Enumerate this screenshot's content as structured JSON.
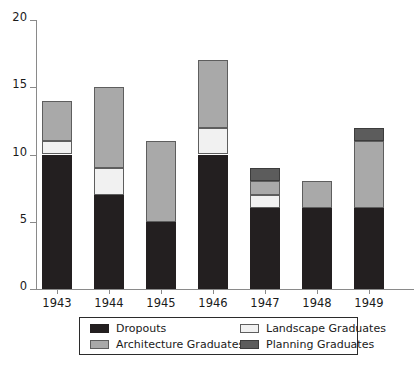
{
  "chart_data": {
    "type": "bar",
    "stacked": true,
    "title": "",
    "subtitle": "",
    "xlabel": "",
    "ylabel": "",
    "categories": [
      "1943",
      "1944",
      "1945",
      "1946",
      "1947",
      "1948",
      "1949"
    ],
    "series": [
      {
        "name": "Dropouts",
        "color": "#231f20",
        "values": [
          10,
          7,
          5,
          10,
          6,
          6,
          6
        ]
      },
      {
        "name": "Landscape Graduates",
        "color": "#f1f1f1",
        "values": [
          1,
          2,
          0,
          2,
          1,
          0,
          0
        ]
      },
      {
        "name": "Architecture Graduates",
        "color": "#a9a9a9",
        "values": [
          3,
          6,
          6,
          5,
          1,
          2,
          5
        ]
      },
      {
        "name": "Planning Graduates",
        "color": "#5c5c5c",
        "values": [
          0,
          0,
          0,
          0,
          1,
          0,
          1
        ]
      }
    ],
    "totals": [
      14,
      15,
      11,
      17,
      9,
      8,
      12
    ],
    "ylim": [
      0,
      20
    ],
    "yticks": [
      0,
      5,
      10,
      15,
      20
    ],
    "ytick_labels": [
      "0",
      "5",
      "10",
      "15",
      "20"
    ],
    "grid": false,
    "legend_position": "bottom"
  },
  "legend": {
    "entries": [
      {
        "label": "Dropouts",
        "swatch": "dropouts"
      },
      {
        "label": "Landscape Graduates",
        "swatch": "landscape"
      },
      {
        "label": "Architecture Graduates",
        "swatch": "architecture"
      },
      {
        "label": "Planning Graduates",
        "swatch": "planning"
      }
    ]
  }
}
